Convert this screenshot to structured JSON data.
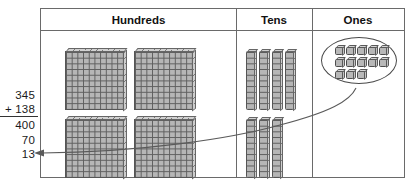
{
  "problem": {
    "label": "vertical-addition",
    "addend1": "345",
    "addend2": "+ 138",
    "partial_hundreds": "400",
    "partial_tens": "70",
    "partial_ones": "13"
  },
  "table": {
    "columns": [
      {
        "key": "hundreds",
        "header": "Hundreds",
        "block_count": 4,
        "value": 400
      },
      {
        "key": "tens",
        "header": "Tens",
        "block_count": 7,
        "value": 70
      },
      {
        "key": "ones",
        "header": "Ones",
        "block_count": 13,
        "value": 13
      }
    ]
  },
  "blocks": {
    "hundreds_flats": [
      {
        "id": "flat-1",
        "left": 24,
        "top": 20
      },
      {
        "id": "flat-2",
        "left": 93,
        "top": 20
      },
      {
        "id": "flat-3",
        "left": 24,
        "top": 88
      },
      {
        "id": "flat-4",
        "left": 93,
        "top": 88
      }
    ],
    "tens_rods": [
      {
        "id": "rod-1",
        "left": 9,
        "top": 20
      },
      {
        "id": "rod-2",
        "left": 22,
        "top": 20
      },
      {
        "id": "rod-3",
        "left": 35,
        "top": 20
      },
      {
        "id": "rod-4",
        "left": 48,
        "top": 20
      },
      {
        "id": "rod-5",
        "left": 9,
        "top": 88
      },
      {
        "id": "rod-6",
        "left": 22,
        "top": 88
      },
      {
        "id": "rod-7",
        "left": 35,
        "top": 88
      }
    ],
    "ones_units": [
      {
        "id": "unit-1",
        "left": 22,
        "top": 16
      },
      {
        "id": "unit-2",
        "left": 33,
        "top": 16
      },
      {
        "id": "unit-3",
        "left": 44,
        "top": 16
      },
      {
        "id": "unit-4",
        "left": 55,
        "top": 16
      },
      {
        "id": "unit-5",
        "left": 66,
        "top": 16
      },
      {
        "id": "unit-6",
        "left": 22,
        "top": 28
      },
      {
        "id": "unit-7",
        "left": 33,
        "top": 28
      },
      {
        "id": "unit-8",
        "left": 44,
        "top": 28
      },
      {
        "id": "unit-9",
        "left": 55,
        "top": 28
      },
      {
        "id": "unit-10",
        "left": 66,
        "top": 28
      },
      {
        "id": "unit-11",
        "left": 22,
        "top": 40
      },
      {
        "id": "unit-12",
        "left": 33,
        "top": 40
      },
      {
        "id": "unit-13",
        "left": 44,
        "top": 40
      }
    ]
  },
  "colors": {
    "border": "#6a6a6a",
    "block_fill": "#b6b6b6",
    "block_line": "#555555",
    "text": "#111111",
    "arrow": "#5a5a5a"
  },
  "arrow": {
    "name": "ones-to-sum-arrow",
    "description": "curved arrow from ones oval to the 13 partial sum"
  }
}
